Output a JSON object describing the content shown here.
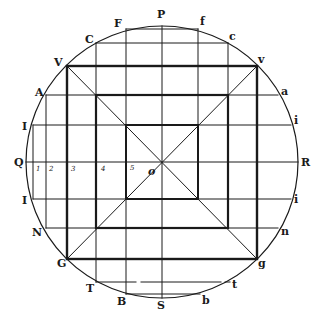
{
  "figure": {
    "type": "geometric construction",
    "colors": {
      "ink": "#1a1a1a",
      "paper": "#ffffff"
    },
    "circle": {
      "cx": 162,
      "cy": 162,
      "r": 136
    },
    "center_label": "o",
    "squares_half_size": [
      95,
      66,
      36
    ]
  },
  "labels": {
    "top": {
      "P": "P",
      "F": "F",
      "f": "f",
      "C": "C",
      "c": "c"
    },
    "upper_left": {
      "V": "V",
      "A": "A",
      "I": "I"
    },
    "upper_right": {
      "v": "v",
      "a": "a",
      "i": "i"
    },
    "middle": {
      "Q": "Q",
      "R": "R"
    },
    "lower_left": {
      "I": "I",
      "N": "N",
      "G": "G"
    },
    "lower_right": {
      "i": "i",
      "n": "n",
      "g": "g"
    },
    "bottom": {
      "T": "T",
      "B": "B",
      "S": "S",
      "b": "b",
      "t": "t"
    },
    "scale_numbers": [
      "1",
      "2",
      "3",
      "4",
      "5"
    ],
    "origin": "o"
  }
}
